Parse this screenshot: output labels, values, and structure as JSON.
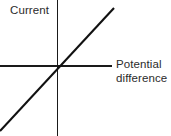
{
  "figure": {
    "kind": "line-graph",
    "width": 171,
    "height": 136,
    "background_color": "#ffffff"
  },
  "labels": {
    "y_axis": "Current",
    "x_axis_line1": "Potential",
    "x_axis_line2": "difference",
    "text_color": "#2b2b2b"
  },
  "chart_data": {
    "type": "line",
    "title": "",
    "subtitle": "",
    "xlabel": "Potential difference",
    "ylabel": "Current",
    "grid": false,
    "legend": null,
    "axis_style": {
      "x_axis": {
        "origin_px": 57,
        "start_px": 0,
        "end_px": 112,
        "y_px": 65.5,
        "stroke_width": 1.6,
        "color": "#1a1a1a",
        "arrowhead": false,
        "ticks": [],
        "tick_labels": []
      },
      "y_axis": {
        "origin_px": 65.5,
        "start_px": 0,
        "end_px": 136,
        "x_px": 57,
        "stroke_width": 1.6,
        "color": "#1a1a1a",
        "arrowhead": false,
        "ticks": [],
        "tick_labels": []
      }
    },
    "xlim": [
      -1,
      1
    ],
    "ylim": [
      -1,
      1
    ],
    "series": [
      {
        "name": "ohmic conductor",
        "color": "#111111",
        "stroke_width": 2.1,
        "x": [
          -1,
          0,
          1
        ],
        "y": [
          -1.14,
          0,
          1.01
        ],
        "points_px": [
          [
            0,
            131
          ],
          [
            57,
            65.5
          ],
          [
            114,
            8
          ]
        ],
        "through_origin": true,
        "slope_sign": "positive",
        "linear": true
      }
    ]
  }
}
